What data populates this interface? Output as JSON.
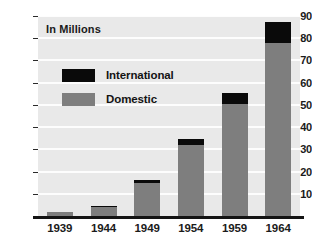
{
  "chart_data": {
    "type": "bar",
    "stacked": true,
    "title": "",
    "subtitle": "",
    "units_label": "In Millions",
    "xlabel": "",
    "ylabel": "",
    "categories": [
      "1939",
      "1944",
      "1949",
      "1954",
      "1959",
      "1964"
    ],
    "series": [
      {
        "name": "Domestic",
        "color": "#7e7e7e",
        "values": [
          2,
          4,
          15,
          32,
          50.5,
          78
        ]
      },
      {
        "name": "International",
        "color": "#0a0a0a",
        "values": [
          0,
          0.5,
          1,
          2.5,
          5,
          9.5
        ]
      }
    ],
    "totals": [
      2,
      4.5,
      16,
      34.5,
      55.5,
      87.5
    ],
    "ylim": [
      0,
      90
    ],
    "ytick_values": [
      10,
      20,
      30,
      40,
      50,
      60,
      70,
      80,
      90
    ],
    "ytick_labels": [
      "10",
      "20",
      "30",
      "40",
      "50",
      "60",
      "70",
      "80",
      "90"
    ],
    "grid": true,
    "grid_color": "#fdfdfd",
    "plot_background": "#e9e9e9",
    "legend_position": "inside-upper-left",
    "legend_entries": [
      {
        "label": "International",
        "color": "#0a0a0a"
      },
      {
        "label": "Domestic",
        "color": "#7e7e7e"
      }
    ]
  }
}
